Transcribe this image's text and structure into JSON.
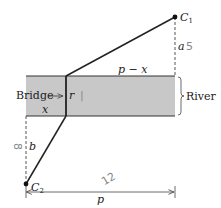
{
  "diagram": {
    "title": "",
    "colors": {
      "river_fill": "#c8c8c8",
      "line": "#222222",
      "dashed": "#555555",
      "handwriting": "#888888"
    },
    "points": {
      "c1": {
        "label": "C",
        "sub": "1"
      },
      "c2": {
        "label": "C",
        "sub": "2"
      }
    },
    "labels": {
      "a": "a",
      "b": "b",
      "r": "r",
      "x": "x",
      "p_minus_x": "p − x",
      "p": "p",
      "bridge": "Bridge",
      "river": "River"
    },
    "annotations": {
      "a_value": "5",
      "b_value": "8",
      "p_value": "12",
      "r_value": "|"
    }
  }
}
